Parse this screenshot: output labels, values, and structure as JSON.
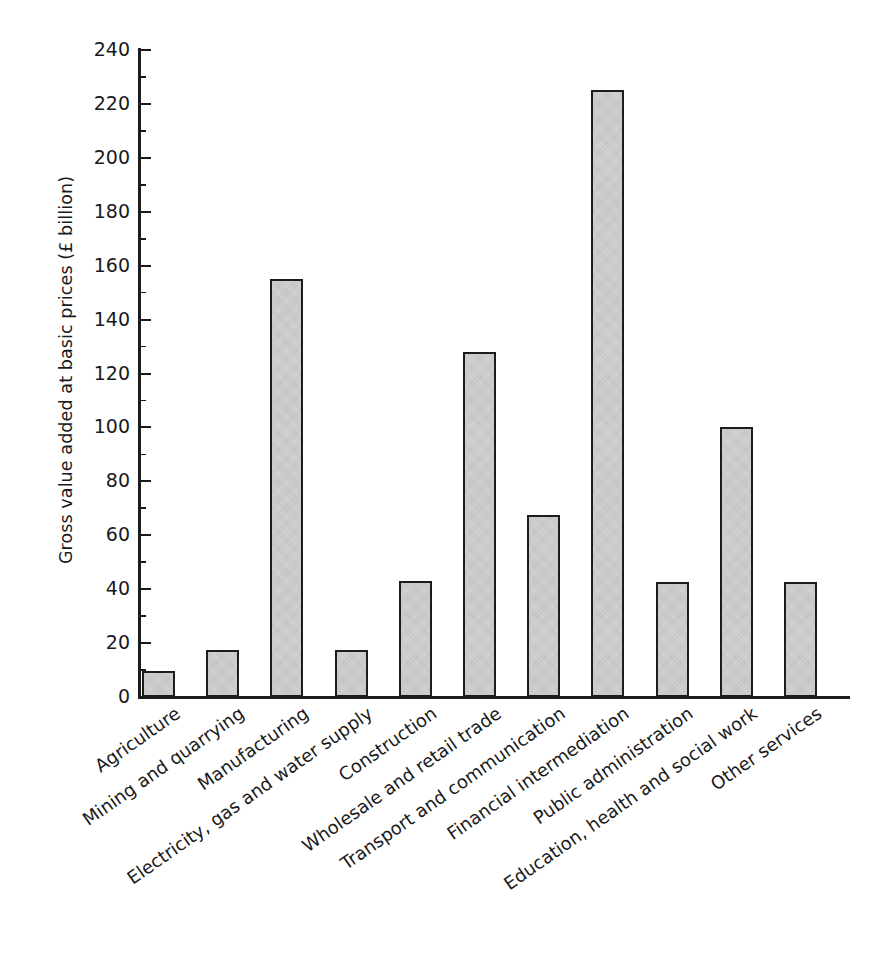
{
  "chart_data": {
    "type": "bar",
    "title": "",
    "xlabel": "",
    "ylabel": "Gross value added at basic prices (£ billion)",
    "ylim": [
      0,
      240
    ],
    "ytick_step": 20,
    "yticks": [
      0,
      20,
      40,
      60,
      80,
      100,
      120,
      140,
      160,
      180,
      200,
      220,
      240
    ],
    "ytick_labels": [
      "0",
      "20",
      "40",
      "60",
      "80",
      "100",
      "120",
      "140",
      "160",
      "180",
      "200",
      "220",
      "240"
    ],
    "minor_ticks": true,
    "minor_tick_step": 10,
    "grid": false,
    "legend": false,
    "bar_fill_color": "#d6d6d6",
    "bar_edge_color": "#1c1c1c",
    "axis_color": "#1c1c1c",
    "background_color": "#ffffff",
    "categories": [
      "Agriculture",
      "Mining and quarrying",
      "Manufacturing",
      "Electricity, gas and water supply",
      "Construction",
      "Wholesale and retail trade",
      "Transport and communication",
      "Financial intermediation",
      "Public administration",
      "Education, health and social work",
      "Other services"
    ],
    "values": [
      9.5,
      17.5,
      155,
      17.5,
      43,
      128,
      67.5,
      225,
      42.5,
      100,
      42.5
    ],
    "xtick_rotation": -35
  }
}
